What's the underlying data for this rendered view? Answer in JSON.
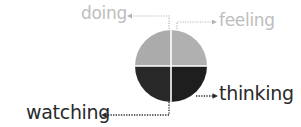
{
  "diagram": {
    "type": "quadrant-circle",
    "quadrants": [
      {
        "position": "top-left",
        "label": "doing",
        "fill": "#ababab",
        "label_color": "#bdbdbd"
      },
      {
        "position": "top-right",
        "label": "feeling",
        "fill": "#b0b0b0",
        "label_color": "#bdbdbd"
      },
      {
        "position": "bottom-right",
        "label": "thinking",
        "fill": "#1e1e1e",
        "label_color": "#2a2a2a"
      },
      {
        "position": "bottom-left",
        "label": "watching",
        "fill": "#282828",
        "label_color": "#2a2a2a"
      }
    ],
    "labels": {
      "doing": "doing",
      "feeling": "feeling",
      "thinking": "thinking",
      "watching": "watching"
    },
    "colors": {
      "light_quadrant": "#ababab",
      "dark_quadrant": "#262626",
      "divider": "#ffffff",
      "light_connector": "#b5b5b5",
      "dark_connector": "#2a2a2a"
    }
  }
}
